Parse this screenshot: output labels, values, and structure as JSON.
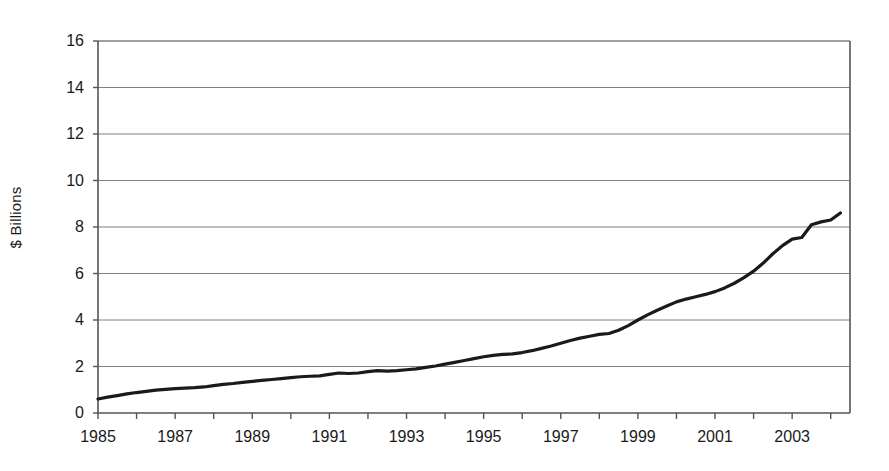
{
  "chart_data": {
    "type": "line",
    "title": "",
    "subtitle": "",
    "xlabel": "",
    "ylabel": "$ Billions",
    "xlim": [
      1985,
      2004.5
    ],
    "ylim": [
      0,
      16
    ],
    "ytick_values": [
      0,
      2,
      4,
      6,
      8,
      10,
      12,
      14,
      16
    ],
    "ytick_labels": [
      "0",
      "2",
      "4",
      "6",
      "8",
      "10",
      "12",
      "14",
      "16"
    ],
    "xtick_values": [
      1985,
      1987,
      1989,
      1991,
      1993,
      1995,
      1997,
      1999,
      2001,
      2003
    ],
    "xtick_labels": [
      "1985",
      "1987",
      "1989",
      "1991",
      "1993",
      "1995",
      "1997",
      "1999",
      "2001",
      "2003"
    ],
    "grid": "horizontal",
    "legend": "none",
    "line_color": "#1a1a1a",
    "line_width": 3.2,
    "gridline_color": "#808080",
    "axis_color": "#555555",
    "background_color": "#ffffff",
    "x": [
      1985.0,
      1985.25,
      1985.5,
      1985.75,
      1986.0,
      1986.25,
      1986.5,
      1986.75,
      1987.0,
      1987.25,
      1987.5,
      1987.75,
      1988.0,
      1988.25,
      1988.5,
      1988.75,
      1989.0,
      1989.25,
      1989.5,
      1989.75,
      1990.0,
      1990.25,
      1990.5,
      1990.75,
      1991.0,
      1991.25,
      1991.5,
      1991.75,
      1992.0,
      1992.25,
      1992.5,
      1992.75,
      1993.0,
      1993.25,
      1993.5,
      1993.75,
      1994.0,
      1994.25,
      1994.5,
      1994.75,
      1995.0,
      1995.25,
      1995.5,
      1995.75,
      1996.0,
      1996.25,
      1996.5,
      1996.75,
      1997.0,
      1997.25,
      1997.5,
      1997.75,
      1998.0,
      1998.25,
      1998.5,
      1998.75,
      1999.0,
      1999.25,
      1999.5,
      1999.75,
      2000.0,
      2000.25,
      2000.5,
      2000.75,
      2001.0,
      2001.25,
      2001.5,
      2001.75,
      2002.0,
      2002.25,
      2002.5,
      2002.75,
      2003.0,
      2003.25,
      2003.5,
      2003.75,
      2004.0,
      2004.25
    ],
    "values": [
      0.6,
      0.68,
      0.75,
      0.82,
      0.88,
      0.93,
      0.98,
      1.02,
      1.05,
      1.07,
      1.09,
      1.12,
      1.18,
      1.23,
      1.27,
      1.32,
      1.36,
      1.4,
      1.44,
      1.48,
      1.52,
      1.56,
      1.58,
      1.6,
      1.66,
      1.72,
      1.7,
      1.72,
      1.78,
      1.82,
      1.8,
      1.82,
      1.86,
      1.9,
      1.96,
      2.02,
      2.1,
      2.18,
      2.26,
      2.34,
      2.42,
      2.48,
      2.52,
      2.54,
      2.6,
      2.68,
      2.78,
      2.88,
      3.0,
      3.12,
      3.22,
      3.3,
      3.38,
      3.42,
      3.56,
      3.76,
      4.0,
      4.22,
      4.42,
      4.6,
      4.78,
      4.9,
      5.0,
      5.1,
      5.22,
      5.38,
      5.58,
      5.82,
      6.1,
      6.45,
      6.85,
      7.2,
      7.48,
      7.55,
      8.1,
      8.22,
      8.3,
      8.6
    ],
    "values_tail": [
      9.1,
      9.7,
      10.3,
      10.9,
      11.18,
      11.22,
      11.7,
      12.3,
      12.7,
      13.0,
      13.4,
      13.45
    ],
    "series_note_first_value": 0.6,
    "series_note_last_value": 13.45
  }
}
